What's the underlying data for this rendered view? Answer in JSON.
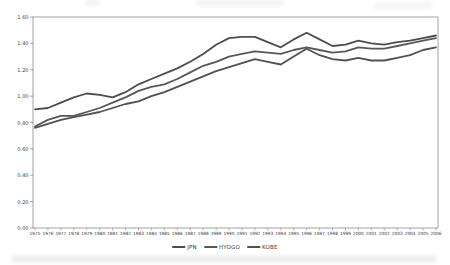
{
  "window": {
    "background": "#ffffff"
  },
  "chart_data": {
    "type": "line",
    "title": "",
    "xlabel": "",
    "ylabel": "",
    "categories": [
      "1975",
      "1976",
      "1977",
      "1978",
      "1979",
      "1980",
      "1981",
      "1982",
      "1983",
      "1984",
      "1985",
      "1986",
      "1987",
      "1988",
      "1989",
      "1990",
      "1991",
      "1992",
      "1993",
      "1994",
      "1995",
      "1996",
      "1997",
      "1998",
      "1999",
      "2000",
      "2001",
      "2002",
      "2003",
      "2004",
      "2005",
      "2006"
    ],
    "series": [
      {
        "name": "JPN",
        "color": "#4d4d4d",
        "values": [
          0.9,
          0.91,
          0.95,
          0.99,
          1.02,
          1.01,
          0.99,
          1.03,
          1.09,
          1.13,
          1.17,
          1.21,
          1.26,
          1.32,
          1.39,
          1.44,
          1.45,
          1.45,
          1.41,
          1.37,
          1.43,
          1.48,
          1.43,
          1.38,
          1.39,
          1.42,
          1.4,
          1.39,
          1.41,
          1.42,
          1.44,
          1.46
        ]
      },
      {
        "name": "HYOGO",
        "color": "#575757",
        "values": [
          0.77,
          0.82,
          0.85,
          0.85,
          0.88,
          0.91,
          0.95,
          0.99,
          1.04,
          1.07,
          1.09,
          1.13,
          1.18,
          1.23,
          1.26,
          1.3,
          1.32,
          1.34,
          1.33,
          1.32,
          1.35,
          1.37,
          1.35,
          1.33,
          1.34,
          1.37,
          1.36,
          1.36,
          1.38,
          1.4,
          1.42,
          1.44
        ]
      },
      {
        "name": "KOBE",
        "color": "#515151",
        "values": [
          0.76,
          0.79,
          0.82,
          0.84,
          0.86,
          0.88,
          0.91,
          0.94,
          0.96,
          1.0,
          1.03,
          1.07,
          1.11,
          1.15,
          1.19,
          1.22,
          1.25,
          1.28,
          1.26,
          1.24,
          1.3,
          1.36,
          1.31,
          1.28,
          1.27,
          1.29,
          1.27,
          1.27,
          1.29,
          1.31,
          1.35,
          1.37
        ]
      }
    ],
    "ylim": [
      0,
      1.6
    ],
    "ytick_step": 0.2,
    "ytick_labels": [
      "0.00",
      "0.20",
      "0.40",
      "0.60",
      "0.80",
      "1.00",
      "1.20",
      "1.40",
      "1.60"
    ],
    "grid": false,
    "legend_position": "bottom-center",
    "axis_color": "#8c8c8c",
    "tick_color": "#6e6e6e",
    "tick_label_color": "#3c3c3c"
  }
}
